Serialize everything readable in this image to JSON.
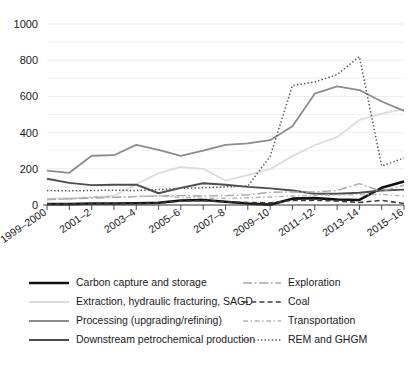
{
  "chart_data": {
    "type": "line",
    "title": "",
    "subtitle": "",
    "xlabel": "",
    "ylabel": "",
    "ylim": [
      0,
      1000
    ],
    "yticks": [
      0,
      200,
      400,
      600,
      800,
      1000
    ],
    "yticks_minor": [
      100,
      300,
      500,
      700,
      900
    ],
    "grid": true,
    "legend_position": "below-two-columns",
    "x": [
      "1999–2000",
      "2000–1",
      "2001–2",
      "2002–3",
      "2003–4",
      "2004–5",
      "2005–6",
      "2006–7",
      "2007–8",
      "2008–9",
      "2009–10",
      "2010–11",
      "2011–12",
      "2012–13",
      "2013–14",
      "2014–15",
      "2015–16"
    ],
    "x_tick_labels_shown": [
      "1999–2000",
      "2001–2",
      "2003–4",
      "2005–6",
      "2007–8",
      "2009–10",
      "2011–12",
      "2013–14",
      "2015–16"
    ],
    "series": [
      {
        "name": "Carbon capture and storage",
        "style": "solid",
        "color": "#111111",
        "width": 2.6,
        "values": [
          5,
          5,
          8,
          8,
          10,
          12,
          25,
          28,
          18,
          8,
          2,
          35,
          38,
          30,
          28,
          95,
          130
        ]
      },
      {
        "name": "Extraction, hydraulic fracturing, SAGD",
        "style": "solid",
        "color": "#dcdcdc",
        "width": 1.8,
        "values": [
          35,
          38,
          42,
          52,
          115,
          175,
          210,
          200,
          135,
          165,
          198,
          270,
          330,
          375,
          470,
          505,
          530
        ]
      },
      {
        "name": "Processing (upgrading/refining)",
        "style": "solid",
        "color": "#8c8c8c",
        "width": 1.8,
        "values": [
          190,
          178,
          272,
          275,
          332,
          305,
          272,
          300,
          332,
          340,
          358,
          435,
          615,
          655,
          635,
          572,
          520
        ]
      },
      {
        "name": "Downstream petrochemical production",
        "style": "solid",
        "color": "#4d4d4d",
        "width": 1.9,
        "values": [
          145,
          122,
          110,
          112,
          112,
          65,
          95,
          120,
          112,
          100,
          92,
          80,
          62,
          62,
          68,
          80,
          85
        ]
      },
      {
        "name": "Exploration",
        "style": "longdash-dot",
        "color": "#a6a6a6",
        "width": 1.4,
        "values": [
          30,
          34,
          38,
          42,
          46,
          50,
          52,
          50,
          52,
          56,
          70,
          72,
          72,
          80,
          118,
          75,
          110
        ]
      },
      {
        "name": "Coal",
        "style": "dash",
        "color": "#3d3d3d",
        "width": 1.6,
        "values": [
          5,
          5,
          6,
          6,
          8,
          10,
          22,
          24,
          18,
          14,
          12,
          25,
          26,
          22,
          14,
          26,
          8
        ]
      },
      {
        "name": "Transportation",
        "style": "dash-dot",
        "color": "#b3b3b3",
        "width": 1.4,
        "values": [
          30,
          32,
          45,
          44,
          48,
          50,
          42,
          38,
          36,
          40,
          44,
          50,
          54,
          56,
          58,
          58,
          50
        ]
      },
      {
        "name": "REM and GHGM",
        "style": "dot",
        "color": "#555555",
        "width": 1.5,
        "values": [
          80,
          78,
          80,
          82,
          80,
          85,
          92,
          95,
          100,
          105,
          268,
          660,
          680,
          720,
          820,
          215,
          260
        ]
      }
    ]
  },
  "axis": {
    "y_labels": [
      "1000",
      "800",
      "600",
      "400",
      "200",
      "0"
    ],
    "x_labels": [
      "1999–2000",
      "2001–2",
      "2003–4",
      "2005–6",
      "2007–8",
      "2009–10",
      "2011–12",
      "2013–14",
      "2015–16"
    ]
  },
  "legend": {
    "left_column": [
      {
        "label": "Carbon capture and storage",
        "style": "solid",
        "color": "#111111",
        "width": 2.6
      },
      {
        "label": "Extraction, hydraulic fracturing, SAGD",
        "style": "solid",
        "color": "#dcdcdc",
        "width": 1.8
      },
      {
        "label": "Processing (upgrading/refining)",
        "style": "solid",
        "color": "#8c8c8c",
        "width": 1.8
      },
      {
        "label": "Downstream petrochemical production",
        "style": "solid",
        "color": "#4d4d4d",
        "width": 1.9
      }
    ],
    "right_column": [
      {
        "label": "Exploration",
        "style": "longdash-dot",
        "color": "#a6a6a6",
        "width": 1.4
      },
      {
        "label": "Coal",
        "style": "dash",
        "color": "#3d3d3d",
        "width": 1.6
      },
      {
        "label": "Transportation",
        "style": "dash-dot",
        "color": "#b3b3b3",
        "width": 1.4
      },
      {
        "label": "REM and GHGM",
        "style": "dot",
        "color": "#555555",
        "width": 1.5
      }
    ]
  },
  "colors": {
    "background": "#ffffff",
    "gridline": "#ebebeb",
    "axis": "#555555",
    "text": "#1a1a1a"
  }
}
